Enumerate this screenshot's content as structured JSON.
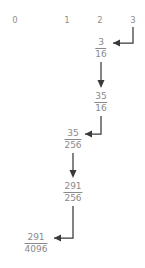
{
  "diagram": {
    "column_headers": [
      {
        "label": "0",
        "x": 15
      },
      {
        "label": "1",
        "x": 67
      },
      {
        "label": "2",
        "x": 100
      },
      {
        "label": "3",
        "x": 133
      }
    ],
    "nodes": [
      {
        "id": "n1",
        "numerator": "3",
        "denominator": "16",
        "x": 101,
        "y": 38
      },
      {
        "id": "n2",
        "numerator": "35",
        "denominator": "16",
        "x": 101,
        "y": 92
      },
      {
        "id": "n3",
        "numerator": "35",
        "denominator": "256",
        "x": 73,
        "y": 129
      },
      {
        "id": "n4",
        "numerator": "291",
        "denominator": "256",
        "x": 73,
        "y": 182
      },
      {
        "id": "n5",
        "numerator": "291",
        "denominator": "4096",
        "x": 36,
        "y": 233
      }
    ],
    "arrows": [
      {
        "id": "a1",
        "from": "col-3",
        "to": "n1",
        "kind": "elbow-down-left"
      },
      {
        "id": "a2",
        "from": "n1",
        "to": "n2",
        "kind": "straight-down"
      },
      {
        "id": "a3",
        "from": "n2",
        "to": "n3",
        "kind": "elbow-down-left"
      },
      {
        "id": "a4",
        "from": "n3",
        "to": "n4",
        "kind": "straight-down"
      },
      {
        "id": "a5",
        "from": "n4",
        "to": "n5",
        "kind": "elbow-down-left"
      }
    ],
    "colors": {
      "text": "#8a8a8a",
      "header_text": "#909090",
      "arrow": "#3a3a3a",
      "background": "#ffffff"
    }
  }
}
